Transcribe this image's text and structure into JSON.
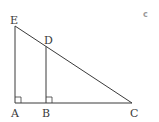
{
  "diagram": {
    "type": "geometry",
    "corner_label": "c",
    "points": {
      "E": {
        "label": "E",
        "x": 15,
        "y": 26
      },
      "D": {
        "label": "D",
        "x": 46,
        "y": 47
      },
      "A": {
        "label": "A",
        "x": 15,
        "y": 103
      },
      "B": {
        "label": "B",
        "x": 46,
        "y": 103
      },
      "C": {
        "label": "C",
        "x": 132,
        "y": 103
      }
    },
    "segments": [
      [
        "E",
        "A"
      ],
      [
        "A",
        "C"
      ],
      [
        "E",
        "C"
      ],
      [
        "D",
        "B"
      ]
    ],
    "right_angles": [
      "A",
      "B"
    ],
    "colors": {
      "line": "#3a3a3a",
      "label": "#3a3a3a",
      "corner_label": "#9a9a9a",
      "background": "#ffffff"
    }
  }
}
